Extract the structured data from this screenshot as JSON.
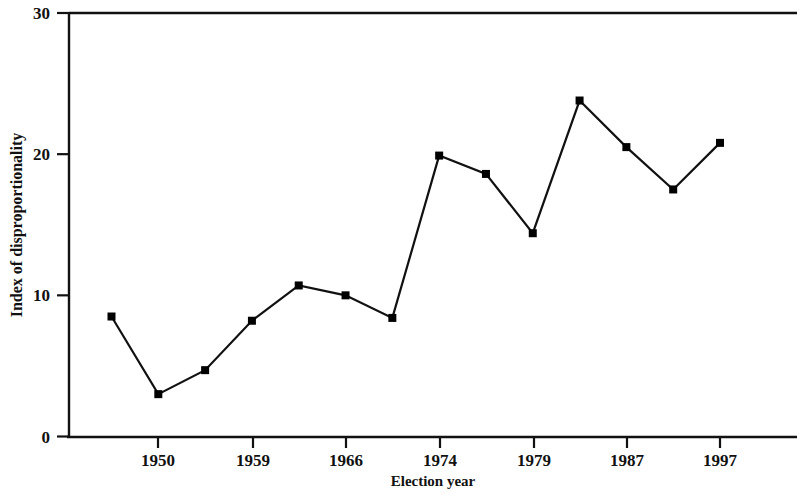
{
  "chart_data": {
    "type": "line",
    "title": "",
    "xlabel": "Election year",
    "ylabel": "Index of disproportionality",
    "xtick_labels": [
      "1950",
      "1959",
      "1966",
      "1974",
      "1979",
      "1987",
      "1997"
    ],
    "ytick_labels": [
      "0",
      "10",
      "20",
      "30"
    ],
    "ylim": [
      0,
      30
    ],
    "grid": false,
    "legend": "none",
    "marker": "square",
    "line_color": "#000000",
    "marker_color": "#000000",
    "background_color": "#ffffff",
    "x": [
      1945,
      1950,
      1955,
      1959,
      1962,
      1966,
      1970,
      1974,
      1976,
      1979,
      1982,
      1987,
      1991,
      1997
    ],
    "values": [
      8.5,
      3.0,
      4.7,
      8.2,
      10.7,
      10.0,
      8.4,
      19.9,
      18.6,
      14.4,
      23.8,
      20.5,
      17.5,
      20.8
    ],
    "series": [
      {
        "name": "Index of disproportionality",
        "values": [
          8.5,
          3.0,
          4.7,
          8.2,
          10.7,
          10.0,
          8.4,
          19.9,
          18.6,
          14.4,
          23.8,
          20.5,
          17.5,
          20.8
        ]
      }
    ]
  }
}
